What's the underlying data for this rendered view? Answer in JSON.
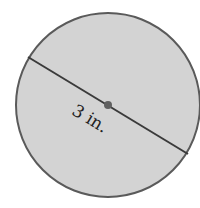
{
  "figure": {
    "shape": "circle",
    "diameter_label": "3 in.",
    "colors": {
      "fill": "#d3d3d3",
      "stroke": "#555555",
      "center_dot": "#606060"
    }
  }
}
